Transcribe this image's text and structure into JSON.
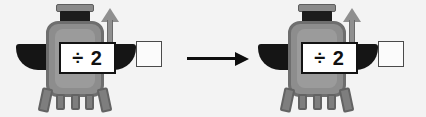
{
  "scene": {
    "background_color": "#f3f3f3",
    "description": "Function machine worksheet"
  },
  "machines": [
    {
      "id": "left",
      "operation_label": "÷ 2",
      "operation_symbol": "÷",
      "operand": "2",
      "answer_box_value": "",
      "parts": {
        "head_plate": "head-plate",
        "head_block": "head-block",
        "torso": "torso",
        "wing_left": "wing-left",
        "wing_right": "wing-right",
        "up_arrow": "up-arrow",
        "legs": 5
      }
    },
    {
      "id": "right",
      "operation_label": "÷ 2",
      "operation_symbol": "÷",
      "operand": "2",
      "answer_box_value": "",
      "parts": {
        "head_plate": "head-plate",
        "head_block": "head-block",
        "torso": "torso",
        "wing_left": "wing-left",
        "wing_right": "wing-right",
        "up_arrow": "up-arrow",
        "legs": 5
      }
    }
  ],
  "flow_arrow": {
    "direction": "right",
    "label": ""
  },
  "colors": {
    "background": "#f3f3f3",
    "body_fill": "#8d8d8d",
    "body_outline": "#6e6e6e",
    "body_inner": "#9b9b9b",
    "wing": "#151515",
    "head_block": "#1c1c1c",
    "label_border": "#131313",
    "label_fill": "#ffffff",
    "label_text": "#111111",
    "answer_box_border": "#4a4a4a",
    "arrow": "#0d0d0d"
  }
}
